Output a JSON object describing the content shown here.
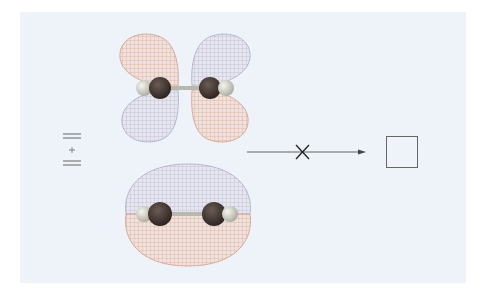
{
  "diagram": {
    "background_color": "#eef2f9",
    "symbol_left": {
      "name": "double-bond-plus-symbol",
      "description": "stacked double bar, plus sign, double bar",
      "parts": [
        "=",
        "+",
        "="
      ]
    },
    "orbitals": [
      {
        "name": "antibonding-pi-orbital",
        "type": "pi*",
        "lobes": 4,
        "phase_colors": [
          "#d8a08c",
          "#b9b4cc"
        ]
      },
      {
        "name": "bonding-pi-orbital",
        "type": "pi",
        "lobes": 2,
        "phase_colors": [
          "#b9b4cc",
          "#d8a08c"
        ]
      }
    ],
    "molecule": {
      "atoms": [
        "H",
        "C",
        "C",
        "H"
      ],
      "carbon_color": "#3a2f2b",
      "hydrogen_color": "#d9dbd2"
    },
    "arrow": {
      "name": "blocked-reaction-arrow",
      "cross_mark": "×",
      "direction": "right"
    },
    "product_box": {
      "name": "empty-product-box",
      "label": ""
    }
  }
}
